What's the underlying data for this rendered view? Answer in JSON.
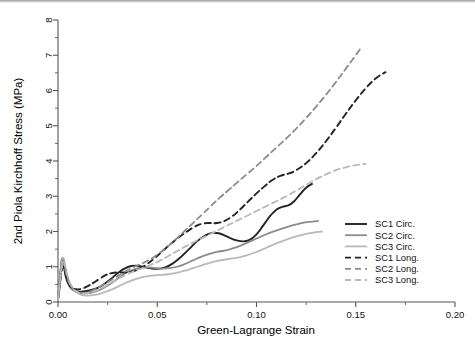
{
  "chart_data": {
    "type": "line",
    "title": "",
    "xlabel": "Green-Lagrange Strain",
    "ylabel": "2nd Piola Kirchhoff Stress (MPa)",
    "xlim": [
      0.0,
      0.2
    ],
    "ylim": [
      0,
      8
    ],
    "xticks": [
      0.0,
      0.05,
      0.1,
      0.15,
      0.2
    ],
    "xtick_labels": [
      "0.00",
      "0.05",
      "0.10",
      "0.15",
      "0.20"
    ],
    "x_minor_ticks": [
      0.025,
      0.075,
      0.125,
      0.175
    ],
    "yticks": [
      0,
      1,
      2,
      3,
      4,
      5,
      6,
      7,
      8
    ],
    "ytick_labels": [
      "0",
      "1",
      "2",
      "3",
      "4",
      "5",
      "6",
      "7",
      "8"
    ],
    "y_minor_ticks": [
      0.5,
      1.5,
      2.5,
      3.5,
      4.5,
      5.5,
      6.5,
      7.5
    ],
    "grid": false,
    "legend_position": "right-middle",
    "series": [
      {
        "name": "SC1 Circ.",
        "style": "solid",
        "color": "#232323",
        "width": 1.9,
        "points": [
          [
            0.0,
            0.05
          ],
          [
            0.0008,
            0.55
          ],
          [
            0.0016,
            1.05
          ],
          [
            0.0022,
            1.22
          ],
          [
            0.003,
            1.0
          ],
          [
            0.004,
            0.7
          ],
          [
            0.0055,
            0.48
          ],
          [
            0.0075,
            0.35
          ],
          [
            0.01,
            0.3
          ],
          [
            0.013,
            0.3
          ],
          [
            0.016,
            0.33
          ],
          [
            0.019,
            0.38
          ],
          [
            0.022,
            0.46
          ],
          [
            0.025,
            0.58
          ],
          [
            0.028,
            0.72
          ],
          [
            0.031,
            0.86
          ],
          [
            0.034,
            0.96
          ],
          [
            0.037,
            1.02
          ],
          [
            0.04,
            1.03
          ],
          [
            0.043,
            1.0
          ],
          [
            0.046,
            0.96
          ],
          [
            0.05,
            0.94
          ],
          [
            0.054,
            0.98
          ],
          [
            0.058,
            1.1
          ],
          [
            0.062,
            1.28
          ],
          [
            0.066,
            1.5
          ],
          [
            0.07,
            1.72
          ],
          [
            0.074,
            1.88
          ],
          [
            0.0775,
            1.96
          ],
          [
            0.081,
            1.95
          ],
          [
            0.085,
            1.86
          ],
          [
            0.089,
            1.76
          ],
          [
            0.093,
            1.72
          ],
          [
            0.0965,
            1.76
          ],
          [
            0.1,
            1.92
          ],
          [
            0.1035,
            2.18
          ],
          [
            0.107,
            2.45
          ],
          [
            0.11,
            2.62
          ],
          [
            0.113,
            2.7
          ],
          [
            0.116,
            2.74
          ],
          [
            0.119,
            2.86
          ],
          [
            0.122,
            3.06
          ],
          [
            0.125,
            3.24
          ],
          [
            0.128,
            3.35
          ]
        ]
      },
      {
        "name": "SC2 Circ.",
        "style": "solid",
        "color": "#8c8c8c",
        "width": 1.8,
        "points": [
          [
            0.0,
            0.05
          ],
          [
            0.0009,
            0.6
          ],
          [
            0.0018,
            1.1
          ],
          [
            0.0025,
            1.25
          ],
          [
            0.0034,
            1.02
          ],
          [
            0.0046,
            0.72
          ],
          [
            0.0062,
            0.48
          ],
          [
            0.0082,
            0.34
          ],
          [
            0.0105,
            0.26
          ],
          [
            0.0135,
            0.24
          ],
          [
            0.0165,
            0.26
          ],
          [
            0.0195,
            0.31
          ],
          [
            0.023,
            0.4
          ],
          [
            0.0265,
            0.52
          ],
          [
            0.03,
            0.66
          ],
          [
            0.0335,
            0.8
          ],
          [
            0.037,
            0.9
          ],
          [
            0.0405,
            0.96
          ],
          [
            0.044,
            0.98
          ],
          [
            0.048,
            0.97
          ],
          [
            0.052,
            0.95
          ],
          [
            0.056,
            0.96
          ],
          [
            0.06,
            1.0
          ],
          [
            0.064,
            1.08
          ],
          [
            0.068,
            1.18
          ],
          [
            0.072,
            1.28
          ],
          [
            0.076,
            1.36
          ],
          [
            0.08,
            1.42
          ],
          [
            0.084,
            1.46
          ],
          [
            0.088,
            1.52
          ],
          [
            0.092,
            1.6
          ],
          [
            0.096,
            1.7
          ],
          [
            0.1,
            1.8
          ],
          [
            0.104,
            1.9
          ],
          [
            0.108,
            1.99
          ],
          [
            0.112,
            2.07
          ],
          [
            0.116,
            2.14
          ],
          [
            0.12,
            2.2
          ],
          [
            0.124,
            2.25
          ],
          [
            0.128,
            2.28
          ],
          [
            0.131,
            2.3
          ]
        ]
      },
      {
        "name": "SC3 Circ.",
        "style": "solid",
        "color": "#b9b9b9",
        "width": 1.8,
        "points": [
          [
            0.0,
            0.05
          ],
          [
            0.001,
            0.62
          ],
          [
            0.002,
            1.12
          ],
          [
            0.0028,
            1.24
          ],
          [
            0.0038,
            0.98
          ],
          [
            0.0052,
            0.66
          ],
          [
            0.007,
            0.42
          ],
          [
            0.0092,
            0.28
          ],
          [
            0.0118,
            0.2
          ],
          [
            0.015,
            0.18
          ],
          [
            0.0185,
            0.2
          ],
          [
            0.022,
            0.25
          ],
          [
            0.026,
            0.33
          ],
          [
            0.03,
            0.43
          ],
          [
            0.034,
            0.54
          ],
          [
            0.038,
            0.63
          ],
          [
            0.042,
            0.7
          ],
          [
            0.046,
            0.74
          ],
          [
            0.05,
            0.76
          ],
          [
            0.0545,
            0.78
          ],
          [
            0.059,
            0.82
          ],
          [
            0.0635,
            0.88
          ],
          [
            0.068,
            0.96
          ],
          [
            0.0725,
            1.04
          ],
          [
            0.077,
            1.12
          ],
          [
            0.0815,
            1.18
          ],
          [
            0.086,
            1.22
          ],
          [
            0.0905,
            1.26
          ],
          [
            0.095,
            1.32
          ],
          [
            0.1,
            1.42
          ],
          [
            0.105,
            1.54
          ],
          [
            0.11,
            1.66
          ],
          [
            0.115,
            1.77
          ],
          [
            0.12,
            1.86
          ],
          [
            0.125,
            1.93
          ],
          [
            0.13,
            1.98
          ],
          [
            0.133,
            2.0
          ]
        ]
      },
      {
        "name": "SC1 Long.",
        "style": "dashed",
        "color": "#232323",
        "width": 1.9,
        "points": [
          [
            0.0,
            0.05
          ],
          [
            0.001,
            0.5
          ],
          [
            0.002,
            0.9
          ],
          [
            0.0028,
            1.0
          ],
          [
            0.0038,
            0.82
          ],
          [
            0.0052,
            0.58
          ],
          [
            0.007,
            0.42
          ],
          [
            0.0092,
            0.36
          ],
          [
            0.012,
            0.38
          ],
          [
            0.015,
            0.45
          ],
          [
            0.018,
            0.55
          ],
          [
            0.021,
            0.66
          ],
          [
            0.024,
            0.76
          ],
          [
            0.027,
            0.82
          ],
          [
            0.03,
            0.84
          ],
          [
            0.0335,
            0.84
          ],
          [
            0.037,
            0.86
          ],
          [
            0.041,
            0.94
          ],
          [
            0.045,
            1.08
          ],
          [
            0.049,
            1.26
          ],
          [
            0.053,
            1.46
          ],
          [
            0.057,
            1.66
          ],
          [
            0.061,
            1.84
          ],
          [
            0.065,
            2.0
          ],
          [
            0.069,
            2.14
          ],
          [
            0.0725,
            2.22
          ],
          [
            0.076,
            2.24
          ],
          [
            0.08,
            2.24
          ],
          [
            0.084,
            2.3
          ],
          [
            0.088,
            2.44
          ],
          [
            0.092,
            2.64
          ],
          [
            0.096,
            2.86
          ],
          [
            0.1,
            3.08
          ],
          [
            0.104,
            3.28
          ],
          [
            0.108,
            3.46
          ],
          [
            0.112,
            3.58
          ],
          [
            0.116,
            3.64
          ],
          [
            0.12,
            3.74
          ],
          [
            0.125,
            3.94
          ],
          [
            0.13,
            4.22
          ],
          [
            0.135,
            4.56
          ],
          [
            0.14,
            4.94
          ],
          [
            0.145,
            5.34
          ],
          [
            0.15,
            5.72
          ],
          [
            0.155,
            6.06
          ],
          [
            0.16,
            6.34
          ],
          [
            0.165,
            6.52
          ]
        ]
      },
      {
        "name": "SC2 Long.",
        "style": "dashed",
        "color": "#8c8c8c",
        "width": 1.8,
        "points": [
          [
            0.0,
            0.05
          ],
          [
            0.0009,
            0.58
          ],
          [
            0.0019,
            1.05
          ],
          [
            0.0027,
            1.18
          ],
          [
            0.0036,
            0.94
          ],
          [
            0.005,
            0.64
          ],
          [
            0.0068,
            0.42
          ],
          [
            0.009,
            0.3
          ],
          [
            0.0115,
            0.26
          ],
          [
            0.0145,
            0.27
          ],
          [
            0.0175,
            0.33
          ],
          [
            0.021,
            0.43
          ],
          [
            0.025,
            0.56
          ],
          [
            0.029,
            0.7
          ],
          [
            0.033,
            0.84
          ],
          [
            0.037,
            0.96
          ],
          [
            0.041,
            1.06
          ],
          [
            0.0455,
            1.18
          ],
          [
            0.05,
            1.34
          ],
          [
            0.0545,
            1.54
          ],
          [
            0.059,
            1.76
          ],
          [
            0.0635,
            2.0
          ],
          [
            0.068,
            2.24
          ],
          [
            0.0725,
            2.48
          ],
          [
            0.077,
            2.72
          ],
          [
            0.0815,
            2.96
          ],
          [
            0.086,
            3.18
          ],
          [
            0.0905,
            3.4
          ],
          [
            0.095,
            3.62
          ],
          [
            0.1,
            3.86
          ],
          [
            0.105,
            4.12
          ],
          [
            0.11,
            4.38
          ],
          [
            0.115,
            4.64
          ],
          [
            0.12,
            4.92
          ],
          [
            0.125,
            5.22
          ],
          [
            0.13,
            5.54
          ],
          [
            0.135,
            5.88
          ],
          [
            0.14,
            6.24
          ],
          [
            0.145,
            6.62
          ],
          [
            0.15,
            7.0
          ],
          [
            0.153,
            7.24
          ]
        ]
      },
      {
        "name": "SC3 Long.",
        "style": "dashed",
        "color": "#b9b9b9",
        "width": 1.8,
        "points": [
          [
            0.0,
            0.05
          ],
          [
            0.001,
            0.56
          ],
          [
            0.0021,
            1.02
          ],
          [
            0.003,
            1.14
          ],
          [
            0.004,
            0.9
          ],
          [
            0.0055,
            0.6
          ],
          [
            0.0074,
            0.4
          ],
          [
            0.0098,
            0.28
          ],
          [
            0.0125,
            0.24
          ],
          [
            0.0158,
            0.26
          ],
          [
            0.0192,
            0.32
          ],
          [
            0.0228,
            0.42
          ],
          [
            0.0265,
            0.54
          ],
          [
            0.0305,
            0.66
          ],
          [
            0.0345,
            0.78
          ],
          [
            0.0385,
            0.88
          ],
          [
            0.0425,
            0.96
          ],
          [
            0.047,
            1.06
          ],
          [
            0.0515,
            1.18
          ],
          [
            0.056,
            1.32
          ],
          [
            0.0605,
            1.46
          ],
          [
            0.065,
            1.6
          ],
          [
            0.07,
            1.74
          ],
          [
            0.075,
            1.88
          ],
          [
            0.08,
            2.02
          ],
          [
            0.085,
            2.16
          ],
          [
            0.09,
            2.3
          ],
          [
            0.095,
            2.44
          ],
          [
            0.1,
            2.58
          ],
          [
            0.105,
            2.72
          ],
          [
            0.11,
            2.86
          ],
          [
            0.115,
            3.0
          ],
          [
            0.12,
            3.16
          ],
          [
            0.125,
            3.32
          ],
          [
            0.13,
            3.48
          ],
          [
            0.135,
            3.62
          ],
          [
            0.14,
            3.74
          ],
          [
            0.145,
            3.82
          ],
          [
            0.15,
            3.88
          ],
          [
            0.155,
            3.92
          ]
        ]
      }
    ],
    "legend": [
      {
        "label": "SC1 Circ.",
        "style": "solid",
        "color": "#232323"
      },
      {
        "label": "SC2 Circ.",
        "style": "solid",
        "color": "#8c8c8c"
      },
      {
        "label": "SC3 Circ.",
        "style": "solid",
        "color": "#b9b9b9"
      },
      {
        "label": "SC1 Long.",
        "style": "dashed",
        "color": "#232323"
      },
      {
        "label": "SC2 Long.",
        "style": "dashed",
        "color": "#8c8c8c"
      },
      {
        "label": "SC3 Long.",
        "style": "dashed",
        "color": "#b9b9b9"
      }
    ]
  }
}
